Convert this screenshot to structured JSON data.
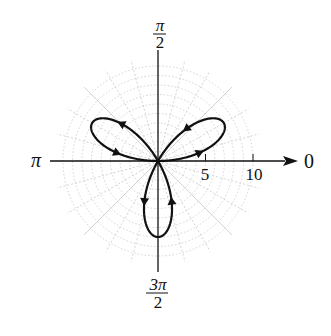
{
  "chart_data": {
    "type": "line",
    "coordinate_system": "polar",
    "title": "",
    "equation": "r = 8 sin(3θ)",
    "series": [
      {
        "name": "rose curve",
        "a": 8,
        "k": 3,
        "function": "sin",
        "theta_range": [
          0,
          3.14159
        ],
        "direction_arrows": true
      }
    ],
    "angle_labels": [
      {
        "angle": "0",
        "label": "0"
      },
      {
        "angle": "pi/2",
        "label_num": "π",
        "label_den": "2"
      },
      {
        "angle": "pi",
        "label": "π"
      },
      {
        "angle": "3pi/2",
        "label_num": "3π",
        "label_den": "2"
      }
    ],
    "radial_ticks": [
      5,
      10
    ],
    "radial_tick_labels": [
      "5",
      "10"
    ],
    "rmax": 10,
    "grid": true,
    "grid_circle_step": 1,
    "grid_angle_step_deg": 15,
    "colors": {
      "curve": "#111111",
      "axis": "#111111",
      "grid": "#c8c8c8"
    }
  }
}
